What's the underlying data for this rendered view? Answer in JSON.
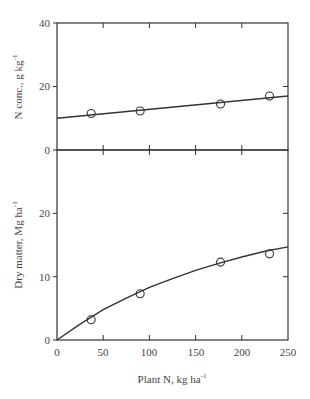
{
  "chart_data": [
    {
      "type": "scatter",
      "panel": "upper",
      "title": "",
      "xlabel": "Plant N, kg ha-1",
      "ylabel": "N conc., g kg-1",
      "xlim": [
        0,
        250
      ],
      "ylim": [
        0,
        40
      ],
      "xticks": [
        0,
        50,
        100,
        150,
        200,
        250
      ],
      "yticks": [
        0,
        20,
        40
      ],
      "grid": false,
      "series": [
        {
          "name": "observed",
          "marker": "open-circle",
          "x": [
            37,
            90,
            177,
            230
          ],
          "y": [
            11.5,
            12.3,
            14.5,
            17.0
          ]
        },
        {
          "name": "fit",
          "marker": "line",
          "x": [
            0,
            250
          ],
          "y": [
            10.0,
            17.0
          ]
        }
      ]
    },
    {
      "type": "scatter",
      "panel": "lower",
      "title": "",
      "xlabel": "Plant N, kg ha-1",
      "ylabel": "Dry matter, Mg ha-1",
      "xlim": [
        0,
        250
      ],
      "ylim": [
        0,
        30
      ],
      "xticks": [
        0,
        50,
        100,
        150,
        200,
        250
      ],
      "yticks": [
        0,
        10,
        20
      ],
      "grid": false,
      "series": [
        {
          "name": "observed",
          "marker": "open-circle",
          "x": [
            37,
            90,
            177,
            230
          ],
          "y": [
            3.2,
            7.3,
            12.3,
            13.6
          ]
        },
        {
          "name": "fit",
          "marker": "curve",
          "x": [
            0,
            25,
            50,
            75,
            100,
            125,
            150,
            175,
            200,
            225,
            250
          ],
          "y": [
            0,
            2.5,
            4.8,
            6.6,
            8.3,
            9.7,
            11.0,
            12.1,
            13.1,
            14.0,
            14.7
          ]
        }
      ]
    }
  ],
  "labels": {
    "upper_ylabel": "N conc., g kg",
    "upper_ylabel_sup": "-1",
    "lower_ylabel": "Dry matter, Mg ha",
    "lower_ylabel_sup": "-1",
    "xlabel": "Plant N, kg ha",
    "xlabel_sup": "-1",
    "upper_yticks": [
      "0",
      "20",
      "40"
    ],
    "lower_yticks": [
      "0",
      "10",
      "20"
    ],
    "xticks": [
      "0",
      "50",
      "100",
      "150",
      "200",
      "250"
    ]
  }
}
